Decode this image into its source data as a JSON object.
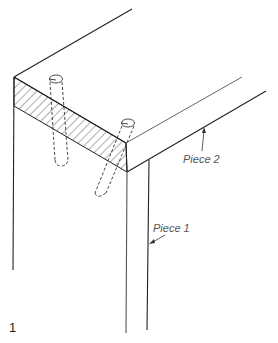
{
  "figure": {
    "number": "1",
    "labels": {
      "piece2": "Piece 2",
      "piece1": "Piece 1"
    }
  },
  "colors": {
    "line": "#222222",
    "label": "#555555",
    "background": "#ffffff"
  }
}
